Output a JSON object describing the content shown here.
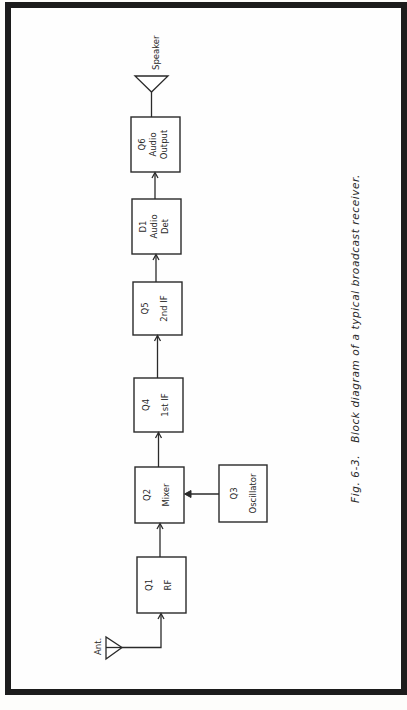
{
  "figure": {
    "caption_number": "Fig. 6-3.",
    "caption_text": "Block diagram of a typical broadcast receiver."
  },
  "diagram": {
    "orientation": "rotated 90° counter-clockwise; signal flows bottom to top",
    "input": {
      "label": "Ant.",
      "symbol": "antenna-triangle"
    },
    "output": {
      "label": "Speaker",
      "symbol": "speaker-triangle"
    },
    "blocks": [
      {
        "id": "Q1",
        "ref": "Q1",
        "name": "RF"
      },
      {
        "id": "Q2",
        "ref": "Q2",
        "name": "Mixer"
      },
      {
        "id": "Q3",
        "ref": "Q3",
        "name": "Oscillator"
      },
      {
        "id": "Q4",
        "ref": "Q4",
        "name": "1st IF"
      },
      {
        "id": "Q5",
        "ref": "Q5",
        "name": "2nd IF"
      },
      {
        "id": "D1",
        "ref": "D1",
        "name_line1": "Audio",
        "name_line2": "Det"
      },
      {
        "id": "Q6",
        "ref": "Q6",
        "name_line1": "Audio",
        "name_line2": "Output"
      }
    ],
    "connections": [
      {
        "from": "Ant.",
        "to": "Q1"
      },
      {
        "from": "Q1",
        "to": "Q2"
      },
      {
        "from": "Q3",
        "to": "Q2"
      },
      {
        "from": "Q2",
        "to": "Q4"
      },
      {
        "from": "Q4",
        "to": "Q5"
      },
      {
        "from": "Q5",
        "to": "D1"
      },
      {
        "from": "D1",
        "to": "Q6"
      },
      {
        "from": "Q6",
        "to": "Speaker"
      }
    ]
  }
}
